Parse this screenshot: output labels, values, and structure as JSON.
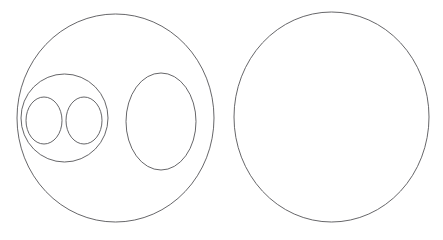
{
  "page": {
    "background_color": "#ffffff",
    "width": 443,
    "height": 240,
    "clipped_header_text": ""
  },
  "style": {
    "stroke_color": "#555558",
    "stroke_color_light": "#6c6c70",
    "stroke_width": 0.9,
    "fill": "none"
  },
  "figures": [
    {
      "id": "left-figure",
      "label": "Left nested ellipse group",
      "shapes": [
        {
          "id": "outer-ellipse",
          "name": "outer-ellipse",
          "type": "ellipse",
          "cx": 115.5,
          "cy": 118,
          "rx": 98.5,
          "ry": 104,
          "stroke": "#555558",
          "stroke_width": 0.9
        },
        {
          "id": "inner-ellipse-left",
          "name": "inner-ellipse-left",
          "type": "ellipse",
          "cx": 64.5,
          "cy": 118,
          "rx": 43.5,
          "ry": 44,
          "stroke": "#555558",
          "stroke_width": 0.9
        },
        {
          "id": "small-circle-left",
          "name": "small-circle-left",
          "type": "ellipse",
          "cx": 44,
          "cy": 120.5,
          "rx": 18,
          "ry": 23.5,
          "stroke": "#555558",
          "stroke_width": 0.9
        },
        {
          "id": "small-circle-right",
          "name": "small-circle-right",
          "type": "ellipse",
          "cx": 84,
          "cy": 120.5,
          "rx": 18,
          "ry": 23.5,
          "stroke": "#555558",
          "stroke_width": 0.9
        },
        {
          "id": "inner-ellipse-right",
          "name": "inner-ellipse-right",
          "type": "ellipse",
          "cx": 161,
          "cy": 121.5,
          "rx": 35,
          "ry": 48.5,
          "stroke": "#555558",
          "stroke_width": 0.9
        }
      ]
    },
    {
      "id": "right-figure",
      "label": "Right empty circle",
      "shapes": [
        {
          "id": "standalone-circle",
          "name": "standalone-circle",
          "type": "ellipse",
          "cx": 331.5,
          "cy": 117,
          "rx": 97.5,
          "ry": 105,
          "stroke": "#555558",
          "stroke_width": 0.9
        }
      ]
    }
  ]
}
